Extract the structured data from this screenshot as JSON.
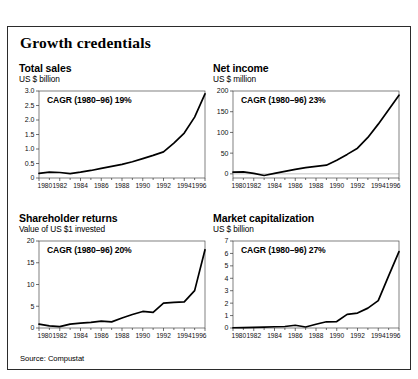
{
  "figure": {
    "title": "Growth credentials",
    "source": "Source: Compustat"
  },
  "chart_data": [
    {
      "type": "line",
      "title": "Total sales",
      "subtitle": "US $ billion",
      "ylabel": "US $ billion",
      "xlabel": "",
      "annotation": "CAGR (1980–96) 19%",
      "grid": false,
      "legend": "none",
      "xlim": [
        1980,
        1996
      ],
      "ylim": [
        0,
        3.0
      ],
      "yticks": [
        0,
        0.5,
        1.0,
        1.5,
        2.0,
        2.5,
        3.0
      ],
      "yticklabels": [
        "0",
        "0.5",
        "1.0",
        "1.5",
        "2.0",
        "2.5",
        "3.0"
      ],
      "xticks": [
        1980,
        1982,
        1984,
        1986,
        1988,
        1990,
        1992,
        1994,
        1996
      ],
      "xticklabels": [
        "1980",
        "1982",
        "1984",
        "1986",
        "1988",
        "1990",
        "1992",
        "1994",
        "1996"
      ],
      "x": [
        1980,
        1981,
        1982,
        1983,
        1984,
        1985,
        1986,
        1987,
        1988,
        1989,
        1990,
        1991,
        1992,
        1993,
        1994,
        1995,
        1996
      ],
      "values": [
        0.16,
        0.2,
        0.19,
        0.15,
        0.2,
        0.26,
        0.33,
        0.4,
        0.47,
        0.56,
        0.67,
        0.78,
        0.9,
        1.2,
        1.55,
        2.1,
        2.9
      ]
    },
    {
      "type": "line",
      "title": "Net income",
      "subtitle": "US $ million",
      "ylabel": "US $ million",
      "xlabel": "",
      "annotation": "CAGR (1980–96) 23%",
      "grid": false,
      "legend": "none",
      "xlim": [
        1980,
        1996
      ],
      "ylim": [
        -10,
        200
      ],
      "yticks": [
        0,
        50,
        100,
        150,
        200
      ],
      "yticklabels": [
        "0",
        "50",
        "100",
        "150",
        "200"
      ],
      "xticks": [
        1980,
        1982,
        1984,
        1986,
        1988,
        1990,
        1992,
        1994,
        1996
      ],
      "xticklabels": [
        "1980",
        "1982",
        "1984",
        "1986",
        "1988",
        "1990",
        "1992",
        "1994",
        "1996"
      ],
      "x": [
        1980,
        1981,
        1982,
        1983,
        1984,
        1985,
        1986,
        1987,
        1988,
        1989,
        1990,
        1991,
        1992,
        1993,
        1994,
        1996
      ],
      "values": [
        4,
        5,
        1,
        -4,
        1,
        6,
        11,
        15,
        18,
        21,
        33,
        47,
        62,
        88,
        120,
        190
      ]
    },
    {
      "type": "line",
      "title": "Shareholder returns",
      "subtitle": "Value of US $1 invested",
      "ylabel": "Value of US $1 invested",
      "xlabel": "",
      "annotation": "CAGR (1980–96) 20%",
      "grid": false,
      "legend": "none",
      "xlim": [
        1980,
        1996
      ],
      "ylim": [
        0,
        20
      ],
      "yticks": [
        0,
        5,
        10,
        15,
        20
      ],
      "yticklabels": [
        "0",
        "5",
        "10",
        "15",
        "20"
      ],
      "xticks": [
        1980,
        1982,
        1984,
        1986,
        1988,
        1990,
        1992,
        1994,
        1996
      ],
      "xticklabels": [
        "1980",
        "1982",
        "1984",
        "1986",
        "1988",
        "1990",
        "1992",
        "1994",
        "1996"
      ],
      "x": [
        1980,
        1981,
        1982,
        1983,
        1984,
        1985,
        1986,
        1987,
        1988,
        1989,
        1990,
        1991,
        1992,
        1993,
        1994,
        1995,
        1996
      ],
      "values": [
        0.9,
        0.5,
        0.3,
        0.9,
        1.1,
        1.3,
        1.6,
        1.4,
        2.3,
        3.1,
        3.8,
        3.6,
        5.7,
        5.9,
        6.0,
        8.6,
        18.0
      ]
    },
    {
      "type": "line",
      "title": "Market capitalization",
      "subtitle": "US $ billion",
      "ylabel": "US $ billion",
      "xlabel": "",
      "annotation": "CAGR (1980–96) 27%",
      "grid": false,
      "legend": "none",
      "xlim": [
        1980,
        1996
      ],
      "ylim": [
        0,
        7
      ],
      "yticks": [
        0,
        1,
        2,
        3,
        4,
        5,
        6,
        7
      ],
      "yticklabels": [
        "0",
        "1",
        "2",
        "3",
        "4",
        "5",
        "6",
        "7"
      ],
      "xticks": [
        1980,
        1982,
        1984,
        1986,
        1988,
        1990,
        1992,
        1994,
        1996
      ],
      "xticklabels": [
        "1980",
        "1982",
        "1984",
        "1986",
        "1988",
        "1990",
        "1992",
        "1994",
        "1996"
      ],
      "x": [
        1980,
        1981,
        1982,
        1983,
        1984,
        1985,
        1986,
        1987,
        1988,
        1989,
        1990,
        1991,
        1992,
        1993,
        1994,
        1995,
        1996
      ],
      "values": [
        0.02,
        0.03,
        0.05,
        0.07,
        0.1,
        0.12,
        0.22,
        0.08,
        0.3,
        0.5,
        0.52,
        1.1,
        1.2,
        1.6,
        2.2,
        4.2,
        6.15
      ]
    }
  ]
}
